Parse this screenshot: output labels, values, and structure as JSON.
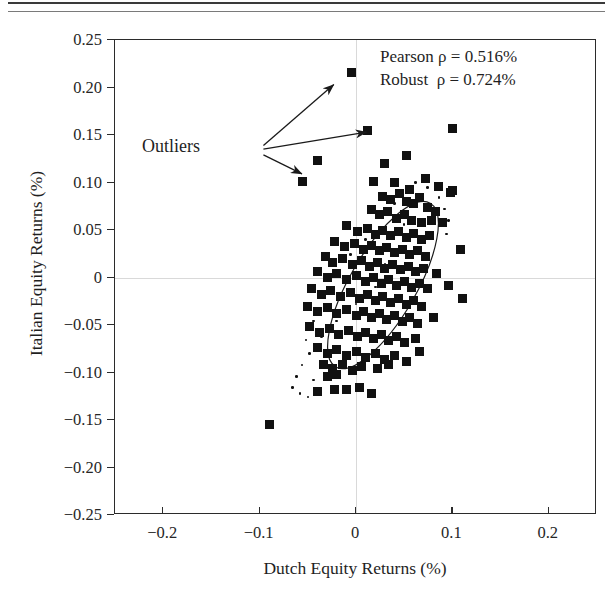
{
  "figure": {
    "title": "",
    "xtitle": "Dutch Equity Returns (%)",
    "ytitle": "Italian Equity Returns (%)",
    "outliers_label": "Outliers",
    "stats_line1": "Pearson ρ = 0.516%",
    "stats_line2": "Robust  ρ = 0.724%",
    "marker_color": "#111111",
    "grid_color": "#d9d9d9",
    "frame_color": "#2b2b2b"
  },
  "chart_data": {
    "type": "scatter",
    "title": "",
    "xlabel": "Dutch Equity Returns (%)",
    "ylabel": "Italian Equity Returns (%)",
    "xlim": [
      -0.25,
      0.25
    ],
    "ylim": [
      -0.25,
      0.25
    ],
    "xticks": [
      -0.2,
      -0.1,
      0,
      0.1,
      0.2
    ],
    "xticklabels": [
      "−0.2",
      "−0.1",
      "0",
      "0.1",
      "0.2"
    ],
    "yticks": [
      0.25,
      0.2,
      0.15,
      0.1,
      0.05,
      0,
      -0.05,
      -0.1,
      -0.15,
      -0.2,
      -0.25
    ],
    "yticklabels": [
      "0.25",
      "0.20",
      "0.15",
      "0.10",
      "0.05",
      "0",
      "−0.05",
      "−0.10",
      "−0.15",
      "−0.20",
      "−0.25"
    ],
    "grid": "zero-lines-only",
    "legend": "none",
    "annotations": [
      {
        "text": "Pearson ρ = 0.516%",
        "x": 0.055,
        "y": 0.228
      },
      {
        "text": "Robust  ρ = 0.724%",
        "x": 0.055,
        "y": 0.206
      },
      {
        "text": "Outliers",
        "x": -0.175,
        "y": 0.145
      }
    ],
    "arrows": [
      {
        "from": [
          -0.095,
          0.138
        ],
        "to": [
          -0.022,
          0.202
        ],
        "label": "Outliers"
      },
      {
        "from": [
          -0.095,
          0.134
        ],
        "to": [
          0.012,
          0.152
        ],
        "label": "Outliers"
      },
      {
        "from": [
          -0.095,
          0.128
        ],
        "to": [
          -0.055,
          0.108
        ],
        "label": "Outliers"
      }
    ],
    "ellipse": {
      "cx": 0.028,
      "cy": -0.008,
      "rx": 0.098,
      "ry": 0.035,
      "angle_deg": -60,
      "note": "robust tolerance ellipse"
    },
    "series": [
      {
        "name": "Dutch vs Italian equity returns",
        "marker": "square",
        "color": "#111111",
        "points": [
          [
            -0.005,
            0.216
          ],
          [
            0.012,
            0.155
          ],
          [
            0.1,
            0.157
          ],
          [
            -0.04,
            0.123
          ],
          [
            -0.055,
            0.101
          ],
          [
            0.03,
            0.12
          ],
          [
            0.052,
            0.128
          ],
          [
            0.018,
            0.101
          ],
          [
            0.04,
            0.1
          ],
          [
            0.056,
            0.093
          ],
          [
            0.072,
            0.104
          ],
          [
            0.086,
            0.096
          ],
          [
            0.098,
            0.09
          ],
          [
            0.027,
            0.085
          ],
          [
            0.036,
            0.082
          ],
          [
            0.045,
            0.088
          ],
          [
            0.052,
            0.08
          ],
          [
            0.06,
            0.078
          ],
          [
            0.066,
            0.084
          ],
          [
            0.074,
            0.074
          ],
          [
            0.082,
            0.069
          ],
          [
            0.016,
            0.072
          ],
          [
            0.024,
            0.066
          ],
          [
            0.033,
            0.07
          ],
          [
            0.042,
            0.062
          ],
          [
            0.05,
            0.066
          ],
          [
            0.058,
            0.06
          ],
          [
            0.068,
            0.058
          ],
          [
            0.078,
            0.06
          ],
          [
            0.09,
            0.058
          ],
          [
            -0.01,
            0.055
          ],
          [
            0.002,
            0.048
          ],
          [
            0.012,
            0.052
          ],
          [
            0.02,
            0.045
          ],
          [
            0.028,
            0.05
          ],
          [
            0.036,
            0.044
          ],
          [
            0.044,
            0.048
          ],
          [
            0.052,
            0.042
          ],
          [
            0.06,
            0.046
          ],
          [
            0.068,
            0.04
          ],
          [
            0.076,
            0.044
          ],
          [
            -0.022,
            0.038
          ],
          [
            -0.012,
            0.033
          ],
          [
            -0.002,
            0.036
          ],
          [
            0.008,
            0.03
          ],
          [
            0.016,
            0.034
          ],
          [
            0.024,
            0.028
          ],
          [
            0.032,
            0.032
          ],
          [
            0.04,
            0.026
          ],
          [
            0.048,
            0.03
          ],
          [
            0.056,
            0.024
          ],
          [
            0.064,
            0.028
          ],
          [
            0.072,
            0.022
          ],
          [
            -0.032,
            0.022
          ],
          [
            -0.024,
            0.016
          ],
          [
            -0.014,
            0.02
          ],
          [
            -0.004,
            0.014
          ],
          [
            0.006,
            0.018
          ],
          [
            0.014,
            0.012
          ],
          [
            0.022,
            0.016
          ],
          [
            0.03,
            0.01
          ],
          [
            0.038,
            0.014
          ],
          [
            0.046,
            0.008
          ],
          [
            0.054,
            0.012
          ],
          [
            0.062,
            0.006
          ],
          [
            0.07,
            0.01
          ],
          [
            0.084,
            0.004
          ],
          [
            -0.04,
            0.006
          ],
          [
            -0.03,
            0.0
          ],
          [
            -0.02,
            0.004
          ],
          [
            -0.01,
            -0.002
          ],
          [
            0.0,
            0.002
          ],
          [
            0.01,
            -0.004
          ],
          [
            0.018,
            0.0
          ],
          [
            0.026,
            -0.006
          ],
          [
            0.034,
            -0.002
          ],
          [
            0.042,
            -0.008
          ],
          [
            0.05,
            -0.004
          ],
          [
            0.058,
            -0.01
          ],
          [
            0.066,
            -0.006
          ],
          [
            0.074,
            -0.012
          ],
          [
            0.096,
            -0.008
          ],
          [
            -0.046,
            -0.012
          ],
          [
            -0.036,
            -0.018
          ],
          [
            -0.026,
            -0.014
          ],
          [
            -0.016,
            -0.02
          ],
          [
            -0.006,
            -0.016
          ],
          [
            0.004,
            -0.022
          ],
          [
            0.012,
            -0.018
          ],
          [
            0.02,
            -0.024
          ],
          [
            0.028,
            -0.02
          ],
          [
            0.036,
            -0.026
          ],
          [
            0.044,
            -0.022
          ],
          [
            0.052,
            -0.028
          ],
          [
            0.06,
            -0.024
          ],
          [
            0.068,
            -0.03
          ],
          [
            -0.05,
            -0.03
          ],
          [
            -0.04,
            -0.036
          ],
          [
            -0.03,
            -0.032
          ],
          [
            -0.02,
            -0.038
          ],
          [
            -0.01,
            -0.034
          ],
          [
            0.0,
            -0.04
          ],
          [
            0.008,
            -0.036
          ],
          [
            0.016,
            -0.042
          ],
          [
            0.024,
            -0.038
          ],
          [
            0.032,
            -0.044
          ],
          [
            0.04,
            -0.04
          ],
          [
            0.048,
            -0.046
          ],
          [
            0.056,
            -0.042
          ],
          [
            0.064,
            -0.048
          ],
          [
            0.08,
            -0.042
          ],
          [
            -0.048,
            -0.052
          ],
          [
            -0.038,
            -0.058
          ],
          [
            -0.028,
            -0.054
          ],
          [
            -0.018,
            -0.06
          ],
          [
            -0.008,
            -0.056
          ],
          [
            0.002,
            -0.062
          ],
          [
            0.01,
            -0.058
          ],
          [
            0.018,
            -0.064
          ],
          [
            0.026,
            -0.06
          ],
          [
            0.034,
            -0.066
          ],
          [
            0.042,
            -0.062
          ],
          [
            0.05,
            -0.068
          ],
          [
            0.062,
            -0.064
          ],
          [
            -0.04,
            -0.074
          ],
          [
            -0.03,
            -0.08
          ],
          [
            -0.02,
            -0.076
          ],
          [
            -0.01,
            -0.082
          ],
          [
            0.0,
            -0.078
          ],
          [
            0.01,
            -0.084
          ],
          [
            0.02,
            -0.08
          ],
          [
            0.03,
            -0.086
          ],
          [
            0.04,
            -0.082
          ],
          [
            0.052,
            -0.088
          ],
          [
            0.066,
            -0.078
          ],
          [
            -0.034,
            -0.092
          ],
          [
            -0.024,
            -0.096
          ],
          [
            -0.014,
            -0.092
          ],
          [
            -0.004,
            -0.098
          ],
          [
            0.006,
            -0.094
          ],
          [
            0.022,
            -0.096
          ],
          [
            0.034,
            -0.092
          ],
          [
            -0.03,
            -0.104
          ],
          [
            -0.02,
            -0.102
          ],
          [
            -0.022,
            -0.118
          ],
          [
            -0.01,
            -0.118
          ],
          [
            0.004,
            -0.116
          ],
          [
            -0.04,
            -0.12
          ],
          [
            0.016,
            -0.122
          ],
          [
            -0.09,
            -0.155
          ],
          [
            0.1,
            0.092
          ],
          [
            0.108,
            0.03
          ],
          [
            0.11,
            -0.022
          ]
        ]
      },
      {
        "name": "minor points",
        "marker": "dot",
        "color": "#111111",
        "points": [
          [
            0.062,
            0.1
          ],
          [
            0.074,
            0.095
          ],
          [
            0.086,
            0.084
          ],
          [
            0.092,
            0.072
          ],
          [
            0.096,
            0.06
          ],
          [
            0.094,
            0.046
          ],
          [
            0.04,
            0.078
          ],
          [
            0.05,
            0.056
          ],
          [
            0.01,
            0.04
          ],
          [
            -0.006,
            0.024
          ],
          [
            0.03,
            0.014
          ],
          [
            0.02,
            -0.01
          ],
          [
            0.0,
            -0.028
          ],
          [
            -0.02,
            -0.046
          ],
          [
            -0.036,
            -0.062
          ],
          [
            -0.048,
            -0.08
          ],
          [
            -0.056,
            -0.092
          ],
          [
            -0.062,
            -0.104
          ],
          [
            -0.066,
            -0.116
          ],
          [
            -0.058,
            -0.122
          ],
          [
            -0.05,
            -0.126
          ],
          [
            -0.044,
            -0.108
          ],
          [
            -0.052,
            -0.066
          ],
          [
            -0.044,
            -0.046
          ]
        ]
      }
    ]
  }
}
